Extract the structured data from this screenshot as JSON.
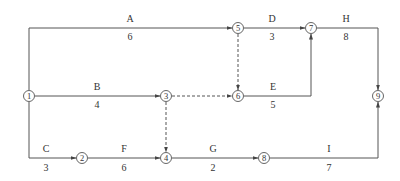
{
  "diagram": {
    "type": "activity-on-arrow network",
    "nodes": [
      {
        "id": "1",
        "label": "1",
        "x": 29,
        "y": 96
      },
      {
        "id": "2",
        "label": "2",
        "x": 82,
        "y": 158
      },
      {
        "id": "3",
        "label": "3",
        "x": 166,
        "y": 96
      },
      {
        "id": "4",
        "label": "4",
        "x": 166,
        "y": 158
      },
      {
        "id": "5",
        "label": "5",
        "x": 238,
        "y": 28
      },
      {
        "id": "6",
        "label": "6",
        "x": 238,
        "y": 96
      },
      {
        "id": "7",
        "label": "7",
        "x": 311,
        "y": 28
      },
      {
        "id": "8",
        "label": "8",
        "x": 264,
        "y": 158
      },
      {
        "id": "9",
        "label": "9",
        "x": 378,
        "y": 96
      }
    ],
    "activities": [
      {
        "name": "A",
        "duration": "6",
        "from": "1",
        "to": "5",
        "dummy": false
      },
      {
        "name": "B",
        "duration": "4",
        "from": "1",
        "to": "3",
        "dummy": false
      },
      {
        "name": "C",
        "duration": "3",
        "from": "1",
        "to": "2",
        "dummy": false
      },
      {
        "name": "D",
        "duration": "3",
        "from": "5",
        "to": "7",
        "dummy": false
      },
      {
        "name": "E",
        "duration": "5",
        "from": "6",
        "to": "7",
        "dummy": false
      },
      {
        "name": "F",
        "duration": "6",
        "from": "2",
        "to": "4",
        "dummy": false
      },
      {
        "name": "G",
        "duration": "2",
        "from": "4",
        "to": "8",
        "dummy": false
      },
      {
        "name": "H",
        "duration": "8",
        "from": "7",
        "to": "9",
        "dummy": false
      },
      {
        "name": "I",
        "duration": "7",
        "from": "8",
        "to": "9",
        "dummy": false
      },
      {
        "name": "",
        "duration": "",
        "from": "5",
        "to": "6",
        "dummy": true
      },
      {
        "name": "",
        "duration": "",
        "from": "3",
        "to": "6",
        "dummy": true
      },
      {
        "name": "",
        "duration": "",
        "from": "3",
        "to": "4",
        "dummy": true
      }
    ]
  },
  "labels": {
    "A": {
      "name": "A",
      "duration": "6"
    },
    "B": {
      "name": "B",
      "duration": "4"
    },
    "C": {
      "name": "C",
      "duration": "3"
    },
    "D": {
      "name": "D",
      "duration": "3"
    },
    "E": {
      "name": "E",
      "duration": "5"
    },
    "F": {
      "name": "F",
      "duration": "6"
    },
    "G": {
      "name": "G",
      "duration": "2"
    },
    "H": {
      "name": "H",
      "duration": "8"
    },
    "I": {
      "name": "I",
      "duration": "7"
    }
  },
  "node_labels": {
    "n1": "1",
    "n2": "2",
    "n3": "3",
    "n4": "4",
    "n5": "5",
    "n6": "6",
    "n7": "7",
    "n8": "8",
    "n9": "9"
  },
  "colors": {
    "line": "#555555",
    "text": "#333333",
    "background": "#ffffff"
  }
}
